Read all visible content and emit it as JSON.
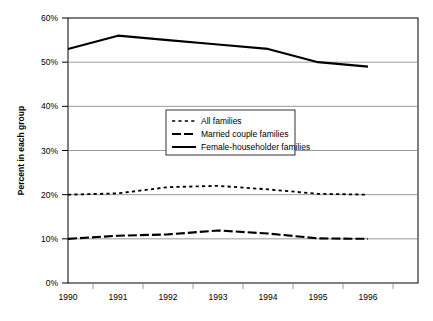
{
  "chart_data": {
    "type": "line",
    "title": "",
    "subtitle": "",
    "xlabel": "",
    "ylabel": "Percent in each group",
    "x": [
      "1990",
      "1991",
      "1992",
      "1993",
      "1994",
      "1995",
      "1996"
    ],
    "categories": [
      "1990",
      "1991",
      "1992",
      "1993",
      "1994",
      "1995",
      "1996"
    ],
    "ylim": [
      0,
      60
    ],
    "yticks": [
      "0%",
      "10%",
      "20%",
      "30%",
      "40%",
      "50%",
      "60%"
    ],
    "ytick_values": [
      0,
      10,
      20,
      30,
      40,
      50,
      60
    ],
    "grid": true,
    "grid_axis": "y",
    "legend_position": "center",
    "series": [
      {
        "name": "All families",
        "style": "dotted",
        "color": "#000000",
        "values": [
          20.0,
          20.3,
          21.7,
          22.0,
          21.2,
          20.2,
          20.0
        ]
      },
      {
        "name": "Married couple families",
        "style": "dashed",
        "color": "#000000",
        "values": [
          10.0,
          10.7,
          11.0,
          11.9,
          11.2,
          10.1,
          10.0
        ]
      },
      {
        "name": "Female-householder families",
        "style": "solid",
        "color": "#000000",
        "values": [
          53.0,
          56.0,
          55.0,
          54.0,
          53.0,
          50.0,
          49.0
        ]
      }
    ]
  },
  "legend": {
    "items": [
      {
        "label": "All families"
      },
      {
        "label": "Married couple families"
      },
      {
        "label": "Female-householder families"
      }
    ]
  },
  "axes": {
    "y_title": "Percent in each group",
    "y_ticks": [
      "60%",
      "50%",
      "40%",
      "30%",
      "20%",
      "10%",
      "0%"
    ],
    "x_ticks": [
      "1990",
      "1991",
      "1992",
      "1993",
      "1994",
      "1995",
      "1996"
    ]
  }
}
